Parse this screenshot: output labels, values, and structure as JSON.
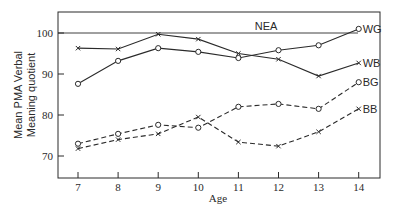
{
  "chart_data": {
    "type": "line",
    "title": "",
    "xlabel": "Age",
    "ylabel": "Mean PMA Verbal Meaning quotient",
    "ylabel_lines": [
      "Mean PMA Verbal",
      "Meaning quotient"
    ],
    "x": [
      7,
      8,
      9,
      10,
      11,
      12,
      13,
      14
    ],
    "xticks": [
      "7",
      "8",
      "9",
      "10",
      "11",
      "12",
      "13",
      "14"
    ],
    "yticks": [
      "70",
      "80",
      "90",
      "100"
    ],
    "ylim": [
      65,
      105
    ],
    "xlim": [
      6.5,
      14.5
    ],
    "grid": false,
    "legend_position": "inline labels at right end of lines",
    "reference_line": {
      "label": "NEA",
      "value": 100
    },
    "series": [
      {
        "name": "WG",
        "marker": "o",
        "linestyle": "solid",
        "values": [
          87.6,
          93.2,
          96.3,
          95.4,
          93.9,
          95.8,
          97.0,
          101.0
        ]
      },
      {
        "name": "WB",
        "marker": "x",
        "linestyle": "solid",
        "values": [
          96.3,
          96.1,
          99.7,
          98.5,
          95.0,
          93.6,
          89.5,
          92.7
        ]
      },
      {
        "name": "BG",
        "marker": "o",
        "linestyle": "dashed",
        "values": [
          73.0,
          75.4,
          77.6,
          76.9,
          82.0,
          82.7,
          81.5,
          88.0
        ]
      },
      {
        "name": "BB",
        "marker": "x",
        "linestyle": "dashed",
        "values": [
          71.8,
          74.0,
          75.4,
          79.5,
          73.4,
          72.4,
          75.9,
          81.5
        ]
      }
    ]
  },
  "colors": {
    "ink": "#2a2a2a",
    "background": "#ffffff"
  }
}
